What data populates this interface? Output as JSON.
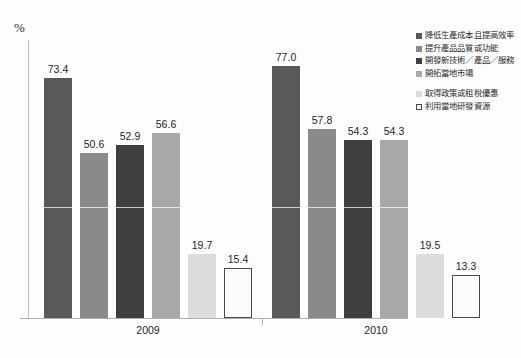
{
  "chart_data": {
    "type": "bar",
    "title": "",
    "subtitle": "",
    "xlabel": "",
    "ylabel": "%",
    "ylim": [
      0,
      85
    ],
    "grid": false,
    "legend_position": "right",
    "categories": [
      "2009",
      "2010"
    ],
    "series": [
      {
        "name": "降低生產成本且提高效率",
        "color": "#595959",
        "border": "",
        "values": [
          73.4,
          77.0
        ],
        "labels": [
          "73.4",
          "77.0"
        ]
      },
      {
        "name": "提升產品品質或功能",
        "color": "#8a8a8a",
        "border": "",
        "values": [
          50.6,
          57.8
        ],
        "labels": [
          "50.6",
          "57.8"
        ]
      },
      {
        "name": "開發新技術／產品／服務",
        "color": "#3f3f3f",
        "border": "",
        "values": [
          52.9,
          54.3
        ],
        "labels": [
          "52.9",
          "54.3"
        ]
      },
      {
        "name": "開拓當地市場",
        "color": "#a8a8a8",
        "border": "",
        "values": [
          56.6,
          54.3
        ],
        "labels": [
          "56.6",
          "54.3"
        ]
      },
      {
        "name": "取得政策或租稅優惠",
        "color": "#dcdcdc",
        "border": "",
        "values": [
          19.7,
          19.5
        ],
        "labels": [
          "19.7",
          "19.5"
        ]
      },
      {
        "name": "利用當地研發資源",
        "color": "#fbfbfb",
        "border": "#4a4a4a",
        "values": [
          15.4,
          13.3
        ],
        "labels": [
          "15.4",
          "13.3"
        ]
      }
    ]
  },
  "axis": {
    "percent_symbol": "%",
    "group_labels": [
      "2009",
      "2010"
    ]
  },
  "legend": {
    "items": [
      "降低生產成本且提高效率",
      "提升產品品質或功能",
      "開發新技術／產品／服務",
      "開拓當地市場",
      "取得政策或租稅優惠",
      "利用當地研發資源"
    ]
  }
}
